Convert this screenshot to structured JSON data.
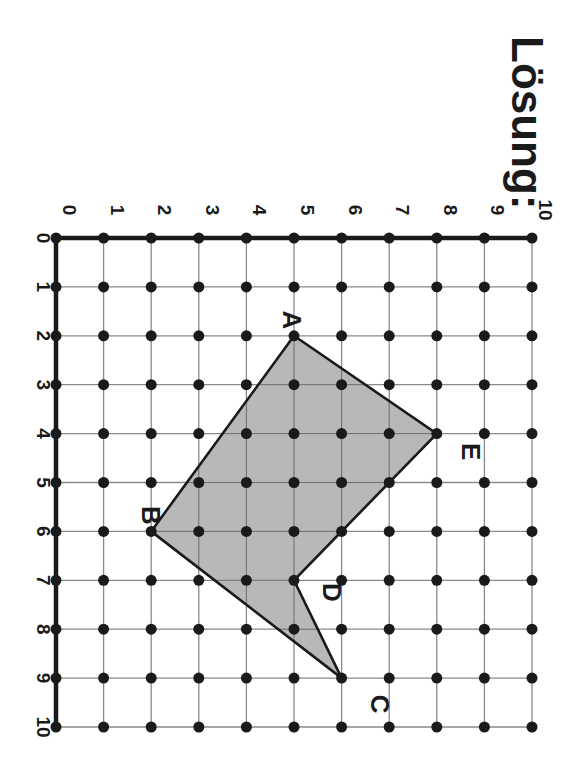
{
  "title": "Lösung:",
  "orientation": "rotated 90° clockwise",
  "grid": {
    "x_min": 0,
    "x_max": 10,
    "y_min": 0,
    "y_max": 10,
    "x_ticks": [
      "0",
      "1",
      "2",
      "3",
      "4",
      "5",
      "6",
      "7",
      "8",
      "9",
      "10"
    ],
    "y_ticks": [
      "0",
      "1",
      "2",
      "3",
      "4",
      "5",
      "6",
      "7",
      "8",
      "9",
      "10"
    ],
    "dots_at_every_integer_point": true
  },
  "polygon": {
    "fill_color": "#b4b4b4",
    "stroke_color": "#1a1a1a",
    "vertices": [
      {
        "label": "A",
        "x": 5,
        "y": 2
      },
      {
        "label": "E",
        "x": 8,
        "y": 4
      },
      {
        "label": "D",
        "x": 5,
        "y": 7
      },
      {
        "label": "C",
        "x": 6,
        "y": 9
      },
      {
        "label": "B",
        "x": 2,
        "y": 6
      }
    ]
  },
  "colors": {
    "grid_line": "#8a8a8a",
    "axis": "#1a1a1a",
    "dot": "#1a1a1a",
    "text": "#1a1a1a"
  }
}
